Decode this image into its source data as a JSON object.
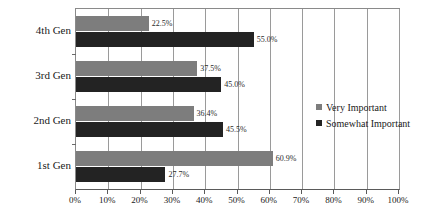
{
  "chart_data": {
    "type": "bar",
    "orientation": "horizontal",
    "title": "",
    "xlabel": "",
    "ylabel": "",
    "categories": [
      "4th Gen",
      "3rd Gen",
      "2nd Gen",
      "1st Gen"
    ],
    "series": [
      {
        "name": "Very Important",
        "color": "#7d7d7d",
        "values": [
          22.5,
          37.5,
          36.4,
          60.9
        ],
        "labels": [
          "22.5%",
          "37.5%",
          "36.4%",
          "60.9%"
        ]
      },
      {
        "name": "Somewhat Important",
        "color": "#232323",
        "values": [
          55.0,
          45.0,
          45.5,
          27.7
        ],
        "labels": [
          "55.0%",
          "45.0%",
          "45.5%",
          "27.7%"
        ]
      }
    ],
    "xlim": [
      0,
      100
    ],
    "xticks": [
      0,
      10,
      20,
      30,
      40,
      50,
      60,
      70,
      80,
      90,
      100
    ],
    "xtick_labels": [
      "0%",
      "10%",
      "20%",
      "30%",
      "40%",
      "50%",
      "60%",
      "70%",
      "80%",
      "90%",
      "100%"
    ],
    "grid": "vertical",
    "legend_position": "right"
  },
  "legend": {
    "items": [
      {
        "label": "Very Important"
      },
      {
        "label": "Somewhat Important"
      }
    ]
  }
}
